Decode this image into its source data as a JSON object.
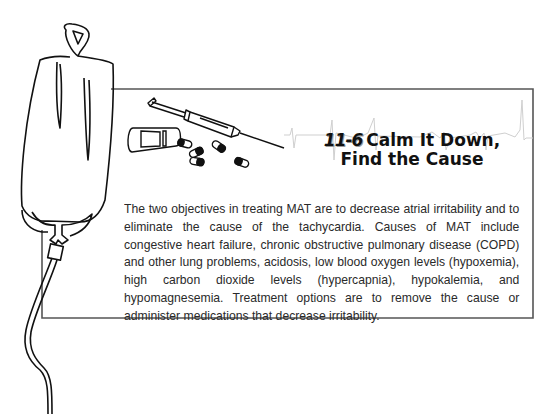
{
  "sidebar_box": {
    "number": "11-6",
    "title_line1": "Calm It Down,",
    "title_line2": "Find the Cause",
    "body": "The two objectives in treating MAT are to decrease atrial irritability and to eliminate the cause of the tachycardia. Causes of MAT include congestive heart failure, chronic obstructive pulmonary disease (COPD) and other lung problems, acidosis, low blood oxygen levels (hypoxemia), high carbon dioxide levels (hypercapnia), hypokalemia, and hypomagnesemia. Treatment options are to remove the cause or administer medications that decrease irritability."
  },
  "illustrations": {
    "left": "iv-bag-icon",
    "top": "syringe-icon",
    "pills": "pill-bottle-icon",
    "background": "ecg-waveform"
  },
  "colors": {
    "border": "#555555",
    "ecg_line": "#cfcfcf",
    "text": "#2a2a2a"
  }
}
